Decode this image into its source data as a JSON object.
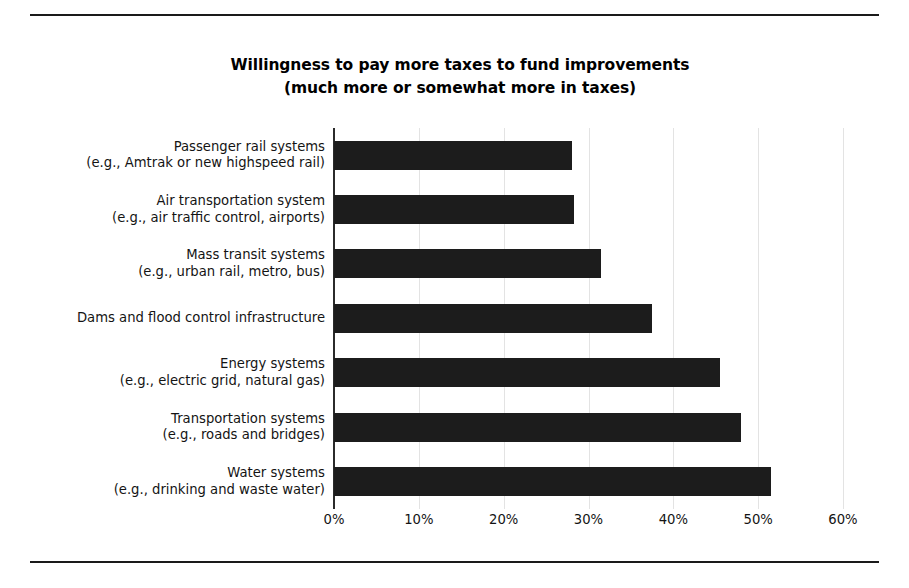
{
  "figure": {
    "title_line1": "Willingness to pay more taxes to fund improvements",
    "title_line2": "(much more or somewhat more in taxes)",
    "bar_color": "#1c1c1c",
    "grid_color": "#e3e3e3",
    "axis_color": "#2b2b2b"
  },
  "chart_data": {
    "type": "bar",
    "orientation": "horizontal",
    "title": "Willingness to pay more taxes to fund improvements (much more or somewhat more in taxes)",
    "xlabel": "",
    "ylabel": "",
    "xlim": [
      0,
      60
    ],
    "grid": true,
    "legend": null,
    "tick_labels": [
      "0%",
      "10%",
      "20%",
      "30%",
      "40%",
      "50%",
      "60%"
    ],
    "ticks": [
      0,
      10,
      20,
      30,
      40,
      50,
      60
    ],
    "categories": [
      "Passenger rail systems (e.g., Amtrak or new highspeed rail)",
      "Air transportation system (e.g., air traffic control, airports)",
      "Mass transit systems (e.g., urban rail, metro, bus)",
      "Dams and flood control infrastructure",
      "Energy systems (e.g., electric grid, natural gas)",
      "Transportation systems (e.g., roads and bridges)",
      "Water systems (e.g., drinking and waste water)"
    ],
    "category_lines": [
      {
        "line1": "Passenger rail systems",
        "line2": "(e.g., Amtrak or new highspeed rail)"
      },
      {
        "line1": "Air transportation system",
        "line2": "(e.g., air traffic control, airports)"
      },
      {
        "line1": "Mass transit systems",
        "line2": "(e.g., urban rail, metro, bus)"
      },
      {
        "line1": "Dams and flood control infrastructure",
        "line2": ""
      },
      {
        "line1": "Energy systems",
        "line2": "(e.g., electric grid, natural gas)"
      },
      {
        "line1": "Transportation systems",
        "line2": "(e.g., roads and bridges)"
      },
      {
        "line1": "Water systems",
        "line2": "(e.g., drinking and waste water)"
      }
    ],
    "values": [
      28,
      28.3,
      31.5,
      37.5,
      45.5,
      48,
      51.5
    ]
  }
}
